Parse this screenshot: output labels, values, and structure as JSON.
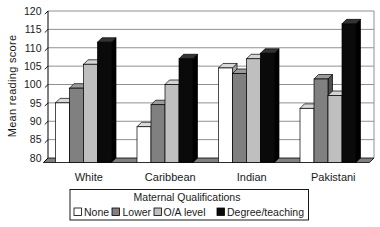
{
  "chart_data": {
    "type": "bar",
    "style": "3d-column",
    "title": "",
    "ylabel": "Mean reading score",
    "xlabel": "",
    "ylim": [
      80,
      120
    ],
    "ytick_step": 5,
    "yticks": [
      80,
      85,
      90,
      95,
      100,
      105,
      110,
      115,
      120
    ],
    "grid": true,
    "categories": [
      "White",
      "Caribbean",
      "Indian",
      "Pakistani"
    ],
    "series": [
      {
        "name": "None",
        "color": "#FFFFFF",
        "values": [
          95,
          88.5,
          104.5,
          93.5
        ]
      },
      {
        "name": "Lower",
        "color": "#808080",
        "values": [
          99,
          94.5,
          103,
          101.5
        ]
      },
      {
        "name": "O/A level",
        "color": "#BFBFBF",
        "values": [
          105.5,
          100,
          107,
          97
        ]
      },
      {
        "name": "Degree/teaching",
        "color": "#0A0A0A",
        "values": [
          111.5,
          107,
          108.5,
          116.5
        ]
      }
    ],
    "legend_title": "Maternal Qualifications",
    "legend_position": "bottom",
    "colors": {
      "gridline": "#909090",
      "floor": "#808080",
      "axis": "#000000"
    }
  }
}
